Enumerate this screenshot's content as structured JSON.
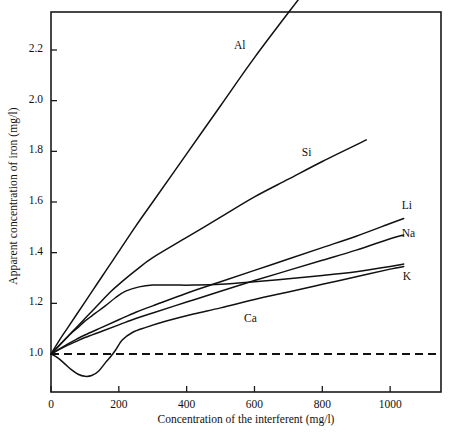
{
  "chart_data": {
    "type": "line",
    "title": "",
    "xlabel": "Concentration of the interferent (mg/l)",
    "ylabel": "Apparent concentration of iron (mg/l)",
    "xlim": [
      0,
      1150
    ],
    "ylim": [
      0.85,
      2.35
    ],
    "xticks": [
      0,
      200,
      400,
      600,
      800,
      1000
    ],
    "xticklabels": [
      "0",
      "200",
      "400",
      "600",
      "800",
      "1000"
    ],
    "yticks": [
      1.0,
      1.2,
      1.4,
      1.6,
      1.8,
      2.0,
      2.2
    ],
    "yticklabels": [
      "1.0",
      "1.2",
      "1.4",
      "1.6",
      "1.8",
      "2.0",
      "2.2"
    ],
    "grid": false,
    "legend": "inline-curve-labels",
    "reference_line": {
      "name": "no-interference-baseline",
      "y": 1.0,
      "style": "dashed",
      "x_start": 0,
      "x_end": 1150
    },
    "series": [
      {
        "name": "Al",
        "label": "Al",
        "label_x": 560,
        "label_y": 2.21,
        "x": [
          0,
          25,
          50,
          75,
          100,
          125,
          150,
          175,
          200,
          250,
          300,
          400,
          500,
          600,
          730
        ],
        "y": [
          1.0,
          1.055,
          1.105,
          1.155,
          1.205,
          1.255,
          1.305,
          1.355,
          1.405,
          1.505,
          1.6,
          1.79,
          1.98,
          2.17,
          2.4
        ]
      },
      {
        "name": "Si",
        "label": "Si",
        "label_x": 760,
        "label_y": 1.79,
        "x": [
          0,
          25,
          50,
          75,
          100,
          125,
          150,
          175,
          200,
          250,
          300,
          400,
          500,
          600,
          700,
          800,
          930
        ],
        "y": [
          1.0,
          1.035,
          1.07,
          1.105,
          1.14,
          1.175,
          1.21,
          1.245,
          1.275,
          1.33,
          1.38,
          1.46,
          1.54,
          1.62,
          1.69,
          1.76,
          1.845
        ]
      },
      {
        "name": "Li",
        "label": "Li",
        "label_x": 1055,
        "label_y": 1.58,
        "x": [
          0,
          25,
          50,
          75,
          100,
          150,
          200,
          250,
          300,
          400,
          500,
          600,
          700,
          800,
          900,
          1000,
          1040
        ],
        "y": [
          1.0,
          1.02,
          1.04,
          1.058,
          1.075,
          1.105,
          1.135,
          1.165,
          1.19,
          1.24,
          1.285,
          1.33,
          1.375,
          1.42,
          1.465,
          1.515,
          1.535
        ]
      },
      {
        "name": "Na",
        "label": "Na",
        "label_x": 1055,
        "label_y": 1.47,
        "x": [
          0,
          25,
          50,
          75,
          100,
          150,
          200,
          250,
          300,
          400,
          500,
          600,
          700,
          800,
          900,
          1000,
          1040
        ],
        "y": [
          1.0,
          1.018,
          1.035,
          1.05,
          1.065,
          1.09,
          1.115,
          1.14,
          1.162,
          1.205,
          1.248,
          1.29,
          1.33,
          1.37,
          1.41,
          1.455,
          1.47
        ]
      },
      {
        "name": "K",
        "label": "K",
        "label_x": 1058,
        "label_y": 1.3,
        "x": [
          0,
          20,
          40,
          60,
          80,
          100,
          130,
          160,
          190,
          220,
          260,
          300,
          360,
          420,
          500,
          600,
          700,
          800,
          900,
          1000,
          1040
        ],
        "y": [
          1.0,
          1.028,
          1.055,
          1.082,
          1.105,
          1.13,
          1.16,
          1.19,
          1.222,
          1.248,
          1.265,
          1.272,
          1.272,
          1.272,
          1.275,
          1.285,
          1.297,
          1.31,
          1.325,
          1.345,
          1.355
        ]
      },
      {
        "name": "Ca",
        "label": "Ca",
        "label_x": 590,
        "label_y": 1.135,
        "x": [
          0,
          20,
          40,
          60,
          80,
          100,
          120,
          140,
          160,
          175,
          190,
          210,
          240,
          280,
          340,
          420,
          500,
          600,
          700,
          800,
          900,
          1000,
          1040
        ],
        "y": [
          1.0,
          0.985,
          0.962,
          0.938,
          0.92,
          0.912,
          0.915,
          0.932,
          0.965,
          0.988,
          1.015,
          1.055,
          1.085,
          1.105,
          1.13,
          1.158,
          1.182,
          1.215,
          1.245,
          1.275,
          1.305,
          1.335,
          1.345
        ]
      }
    ]
  },
  "axis_labels": {
    "x": "Concentration of the interferent (mg/l)",
    "y": "Apparent concentration of iron (mg/l)"
  }
}
